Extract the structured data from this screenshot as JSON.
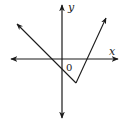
{
  "diagram": {
    "type": "function-graph",
    "axes": {
      "x_label": "x",
      "y_label": "y",
      "origin_label": "0"
    },
    "graph": {
      "shape": "V",
      "vertex_position": "below x-axis, right of y-axis (fourth quadrant)",
      "left_branch": "extends up-left through second quadrant, crossing x-axis left of origin",
      "right_branch": "extends up-right through first quadrant, crossing x-axis right of origin"
    },
    "colors": {
      "line": "#1a1a1a",
      "background": "#ffffff"
    }
  }
}
